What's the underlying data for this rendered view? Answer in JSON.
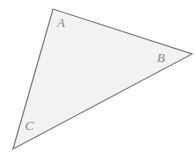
{
  "figure": {
    "kind": "geometry-diagram",
    "shape": "triangle",
    "background_color": "#ffffff",
    "fill_color": "#f2f2f2",
    "stroke_color": "#808080",
    "stroke_width": 1.3,
    "label_color": "#8a8a8a",
    "canvas": {
      "width": 196,
      "height": 155
    },
    "vertices": [
      {
        "name": "A",
        "label": "A",
        "x": 53,
        "y": 9,
        "label_x": 57,
        "label_y": 16
      },
      {
        "name": "B",
        "label": "B",
        "x": 192,
        "y": 54,
        "label_x": 157,
        "label_y": 51
      },
      {
        "name": "C",
        "label": "C",
        "x": 13,
        "y": 149,
        "label_x": 25,
        "label_y": 119
      }
    ],
    "edges": [
      {
        "name": "AB",
        "from": "A",
        "to": "B"
      },
      {
        "name": "BC",
        "from": "B",
        "to": "C"
      },
      {
        "name": "CA",
        "from": "C",
        "to": "A"
      }
    ],
    "polygon_points": "53,9 192,54 13,149"
  }
}
